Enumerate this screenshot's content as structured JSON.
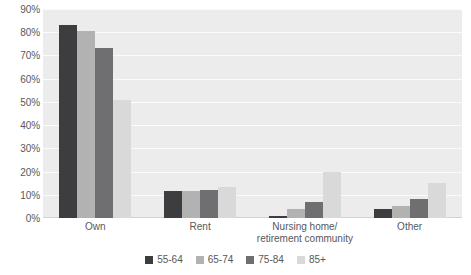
{
  "chart_data": {
    "type": "bar",
    "title": "",
    "subtitle": "",
    "xlabel": "",
    "ylabel": "",
    "ylim": [
      0,
      90
    ],
    "ytick_step": 10,
    "grid": true,
    "legend_position": "bottom",
    "value_suffix": "%",
    "categories": [
      "Own",
      "Rent",
      "Nursing home/\nretirement community",
      "Other"
    ],
    "category_lines": [
      [
        "Own"
      ],
      [
        "Rent"
      ],
      [
        "Nursing home/",
        "retirement community"
      ],
      [
        "Other"
      ]
    ],
    "ytick_labels": [
      "90%",
      "80%",
      "70%",
      "60%",
      "50%",
      "40%",
      "30%",
      "20%",
      "10%",
      "0%"
    ],
    "ytick_values": [
      90,
      80,
      70,
      60,
      50,
      40,
      30,
      20,
      10,
      0
    ],
    "series": [
      {
        "name": "55-64",
        "color": "#3d3d3f",
        "values": [
          83,
          11.5,
          1,
          4
        ]
      },
      {
        "name": "65-74",
        "color": "#b2b2b2",
        "values": [
          80.5,
          11.5,
          4,
          5
        ]
      },
      {
        "name": "75-84",
        "color": "#6f6f71",
        "values": [
          73,
          12,
          7,
          8
        ]
      },
      {
        "name": "85+",
        "color": "#d9d9d9",
        "values": [
          51,
          13.5,
          20,
          15
        ]
      }
    ]
  },
  "colors": {
    "plot_background": "#ececec",
    "gridline": "#fbfbfb",
    "axis_text": "#58585a",
    "page_background": "#ffffff"
  }
}
